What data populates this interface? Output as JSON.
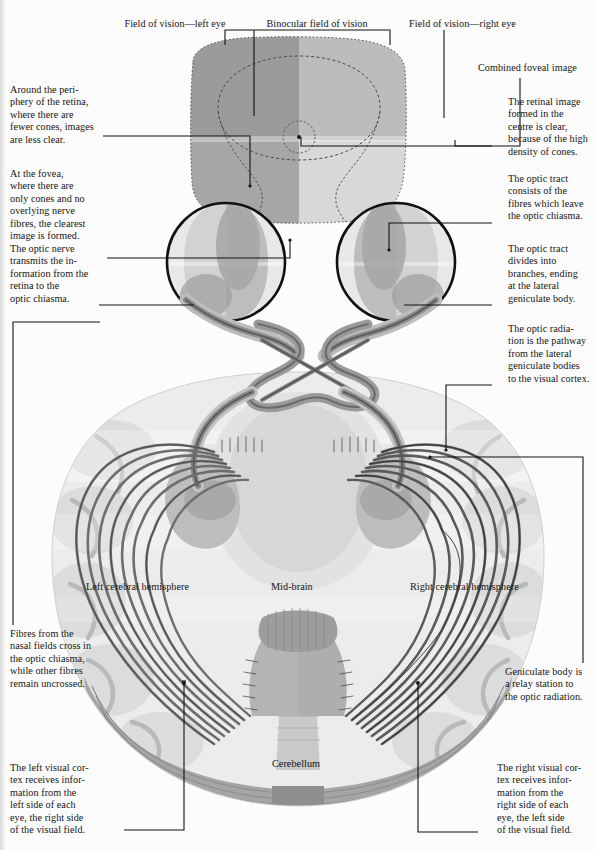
{
  "figure": {
    "title_role": "visual-pathway-anatomical-diagram",
    "background_color": "#fcfcfc",
    "ink_color": "#141414"
  },
  "top_labels": [
    {
      "id": "field-left-eye",
      "text": "Field of vision—left eye"
    },
    {
      "id": "binocular",
      "text": "Binocular field of vision"
    },
    {
      "id": "field-right-eye",
      "text": "Field of vision—right eye"
    },
    {
      "id": "combined-foveal",
      "text": "Combined foveal image"
    }
  ],
  "left_captions": [
    {
      "id": "periphery-retina",
      "lines": [
        "Around the peri-",
        "phery of the retina,",
        "where there are",
        "fewer cones, images",
        "are less clear."
      ]
    },
    {
      "id": "at-the-fovea",
      "lines": [
        "At the fovea,",
        "where there are",
        "only cones and no",
        "overlying nerve",
        "fibres, the clearest",
        "image is formed."
      ]
    },
    {
      "id": "optic-nerve",
      "lines": [
        "The optic nerve",
        "transmits the in-",
        "formation from the",
        "retina to the",
        "optic chiasma."
      ]
    },
    {
      "id": "nasal-fields-cross",
      "lines": [
        "Fibres from the",
        "nasal fields cross in",
        "the optic chiasma,",
        "while other fibres",
        "remain uncrossed."
      ]
    },
    {
      "id": "left-visual-cortex",
      "lines": [
        "The left visual cor-",
        "tex receives infor-",
        "mation from the",
        "left side of each",
        "eye, the right side",
        "of the visual field."
      ]
    }
  ],
  "right_captions": [
    {
      "id": "retinal-image-centre",
      "lines": [
        "The retinal image",
        "formed in the",
        "centre is clear,",
        "because of the high",
        "density of cones."
      ]
    },
    {
      "id": "optic-tract-fibres",
      "lines": [
        "The optic tract",
        "consists of the",
        "fibres which leave",
        "the optic chiasma."
      ]
    },
    {
      "id": "optic-tract-divides",
      "lines": [
        "The optic tract",
        "divides into",
        "branches, ending",
        "at the lateral",
        "geniculate body."
      ]
    },
    {
      "id": "optic-radiation",
      "lines": [
        "The optic radia-",
        "tion is the pathway",
        "from the lateral",
        "geniculate bodies",
        "to the visual cortex."
      ]
    },
    {
      "id": "geniculate-body",
      "lines": [
        "Geniculate body is",
        "a relay station to",
        "the optic radiation."
      ]
    },
    {
      "id": "right-visual-cortex",
      "lines": [
        "The right visual cor-",
        "tex receives infor-",
        "mation from the",
        "right side of each",
        "eye, the left side",
        "of the visual field."
      ]
    }
  ],
  "inline_labels": [
    {
      "id": "left-hemisphere",
      "text": "Left cerebral hemisphere",
      "x": 86,
      "y": 588
    },
    {
      "id": "mid-brain",
      "text": "Mid-brain",
      "x": 271,
      "y": 588
    },
    {
      "id": "right-hemisphere",
      "text": "Right cerebral hemisphere",
      "x": 410,
      "y": 588
    },
    {
      "id": "cerebellum",
      "text": "Cerebellum",
      "x": 272,
      "y": 765
    }
  ],
  "palette": {
    "field_upper_left": "#9e9e9e",
    "field_upper_right": "#bdbdbd",
    "field_lower_left": "#a8a8a8",
    "field_lower_right": "#d6d6d6",
    "brain_light": "#ededed",
    "brain_mid": "#dcdcdc",
    "brain_shadow": "#c2c2c2",
    "brain_deep": "#a9a9a9",
    "fibre_dark": "#6d6d6d",
    "fibre_darker": "#4a4a4a",
    "outline": "#111111"
  }
}
